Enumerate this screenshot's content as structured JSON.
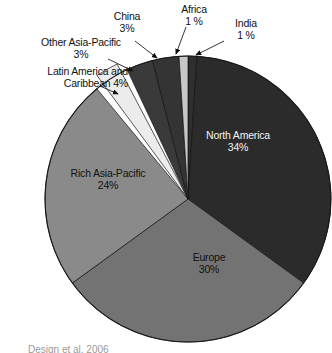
{
  "chart_data": {
    "type": "pie",
    "title": "",
    "subtitle": "",
    "xlabel": "",
    "ylabel": "",
    "legend_position": "none",
    "grid": false,
    "units": "percent",
    "total": 100,
    "start_angle_deg": 0,
    "direction": "clockwise",
    "categories": [
      "India",
      "North America",
      "Europe",
      "Rich Asia-Pacific",
      "Latin America and Caribbean",
      "Other Asia-Pacific",
      "China",
      "Africa"
    ],
    "values": [
      1,
      34,
      30,
      24,
      4,
      3,
      3,
      1
    ],
    "slices": [
      {
        "name": "India",
        "value": 1,
        "label": "India",
        "pct_text": "1 %",
        "color": "#2f2f2f",
        "label_style": "callout",
        "label_side": "right"
      },
      {
        "name": "North America",
        "value": 34,
        "label": "North America",
        "pct_text": "34%",
        "color": "#2b2b2b",
        "label_style": "inside",
        "label_side": "right"
      },
      {
        "name": "Europe",
        "value": 30,
        "label": "Europe",
        "pct_text": "30%",
        "color": "#737373",
        "label_style": "inside",
        "label_side": "bottom"
      },
      {
        "name": "Rich Asia-Pacific",
        "value": 24,
        "label": "Rich Asia-Pacific",
        "pct_text": "24%",
        "color": "#8a8a8a",
        "label_style": "inside",
        "label_side": "left"
      },
      {
        "name": "Latin America and Caribbean",
        "value": 4,
        "label": "Latin America and",
        "pct_text": "Caribbean 4%",
        "color": "#ececec",
        "label_style": "callout",
        "label_side": "left"
      },
      {
        "name": "Other Asia-Pacific",
        "value": 3,
        "label": "Other Asia-Pacific",
        "pct_text": "3%",
        "color": "#3a3a3a",
        "label_style": "callout",
        "label_side": "left"
      },
      {
        "name": "China",
        "value": 3,
        "label": "China",
        "pct_text": "3%",
        "color": "#343434",
        "label_style": "callout",
        "label_side": "top"
      },
      {
        "name": "Africa",
        "value": 1,
        "label": "Africa",
        "pct_text": "1 %",
        "color": "#c8c8c8",
        "label_style": "callout",
        "label_side": "top"
      }
    ]
  },
  "labels": {
    "other_asia_pacific": {
      "name": "Other Asia-Pacific",
      "pct": "3%"
    },
    "china": {
      "name": "China",
      "pct": "3%"
    },
    "africa": {
      "name": "Africa",
      "pct": "1 %"
    },
    "india": {
      "name": "India",
      "pct": "1 %"
    },
    "latin_america": {
      "name": "Latin America and",
      "pct": "Caribbean 4%"
    },
    "north_america": {
      "name": "North America",
      "pct": "34%"
    },
    "rich_asia_pacific": {
      "name": "Rich Asia-Pacific",
      "pct": "24%"
    },
    "europe": {
      "name": "Europe",
      "pct": "30%"
    }
  },
  "caption": {
    "text": "Design et al. 2006"
  }
}
